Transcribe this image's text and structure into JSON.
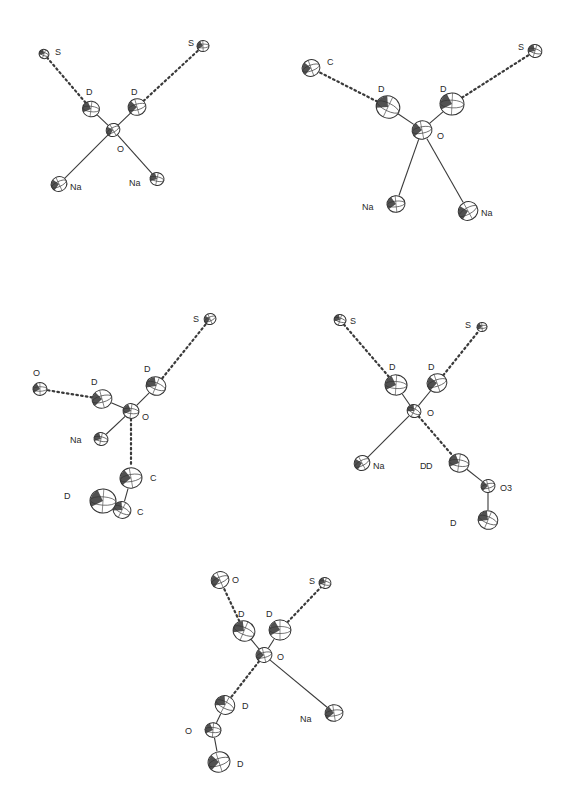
{
  "figure": {
    "panels": [
      {
        "id": "panel-1",
        "atoms": [
          {
            "id": "O",
            "label": "O",
            "x": 113,
            "y": 130,
            "r": 7,
            "lx": 117,
            "ly": 152
          },
          {
            "id": "D1",
            "label": "D",
            "x": 91,
            "y": 109,
            "r": 8.5,
            "lx": 86,
            "ly": 95
          },
          {
            "id": "D2",
            "label": "D",
            "x": 137,
            "y": 107,
            "r": 9,
            "lx": 131,
            "ly": 95
          },
          {
            "id": "S1",
            "label": "S",
            "x": 44,
            "y": 54,
            "r": 5,
            "lx": 55,
            "ly": 55
          },
          {
            "id": "S2",
            "label": "S",
            "x": 203,
            "y": 46,
            "r": 6,
            "lx": 188,
            "ly": 46
          },
          {
            "id": "Na1",
            "label": "Na",
            "x": 59,
            "y": 184,
            "r": 8,
            "lx": 70,
            "ly": 190
          },
          {
            "id": "Na2",
            "label": "Na",
            "x": 157,
            "y": 179,
            "r": 7,
            "lx": 129,
            "ly": 186
          }
        ],
        "bonds": [
          [
            "O",
            "D1"
          ],
          [
            "O",
            "D2"
          ],
          [
            "O",
            "Na1"
          ],
          [
            "O",
            "Na2"
          ]
        ],
        "hbonds": [
          [
            "D1",
            "S1"
          ],
          [
            "D2",
            "S2"
          ]
        ]
      },
      {
        "id": "panel-2",
        "atoms": [
          {
            "id": "O",
            "label": "O",
            "x": 422,
            "y": 130,
            "r": 10,
            "lx": 437,
            "ly": 139
          },
          {
            "id": "D1",
            "label": "D",
            "x": 388,
            "y": 107,
            "r": 12,
            "lx": 378,
            "ly": 92
          },
          {
            "id": "D2",
            "label": "D",
            "x": 452,
            "y": 104,
            "r": 12,
            "lx": 440,
            "ly": 92
          },
          {
            "id": "C",
            "label": "C",
            "x": 311,
            "y": 68,
            "r": 9,
            "lx": 327,
            "ly": 65
          },
          {
            "id": "S",
            "label": "S",
            "x": 535,
            "y": 51,
            "r": 7,
            "lx": 518,
            "ly": 50
          },
          {
            "id": "Na1",
            "label": "Na",
            "x": 396,
            "y": 204,
            "r": 9,
            "lx": 362,
            "ly": 210
          },
          {
            "id": "Na2",
            "label": "Na",
            "x": 468,
            "y": 211,
            "r": 10,
            "lx": 481,
            "ly": 216
          }
        ],
        "bonds": [
          [
            "O",
            "D1"
          ],
          [
            "O",
            "D2"
          ],
          [
            "O",
            "Na1"
          ],
          [
            "O",
            "Na2"
          ]
        ],
        "hbonds": [
          [
            "D1",
            "C"
          ],
          [
            "D2",
            "S"
          ]
        ]
      },
      {
        "id": "panel-3",
        "atoms": [
          {
            "id": "O",
            "label": "O",
            "x": 131,
            "y": 411,
            "r": 8,
            "lx": 142,
            "ly": 420
          },
          {
            "id": "D1",
            "label": "D",
            "x": 102,
            "y": 399,
            "r": 10,
            "lx": 91,
            "ly": 385
          },
          {
            "id": "D2",
            "label": "D",
            "x": 156,
            "y": 386,
            "r": 10,
            "lx": 144,
            "ly": 372
          },
          {
            "id": "O2",
            "label": "O",
            "x": 40,
            "y": 389,
            "r": 7,
            "lx": 33,
            "ly": 376
          },
          {
            "id": "S",
            "label": "S",
            "x": 210,
            "y": 319,
            "r": 6,
            "lx": 193,
            "ly": 322
          },
          {
            "id": "Na",
            "label": "Na",
            "x": 101,
            "y": 439,
            "r": 7,
            "lx": 70,
            "ly": 443
          },
          {
            "id": "C1",
            "label": "C",
            "x": 131,
            "y": 478,
            "r": 11,
            "lx": 150,
            "ly": 481
          },
          {
            "id": "C2",
            "label": "C",
            "x": 122,
            "y": 510,
            "r": 9,
            "lx": 137,
            "ly": 515
          },
          {
            "id": "D3",
            "label": "D",
            "x": 103,
            "y": 501,
            "r": 13,
            "lx": 64,
            "ly": 499
          }
        ],
        "bonds": [
          [
            "O",
            "D1"
          ],
          [
            "O",
            "D2"
          ],
          [
            "O",
            "Na"
          ],
          [
            "C1",
            "C2"
          ]
        ],
        "hbonds": [
          [
            "D1",
            "O2"
          ],
          [
            "D2",
            "S"
          ],
          [
            "O",
            "C1"
          ]
        ]
      },
      {
        "id": "panel-4",
        "atoms": [
          {
            "id": "O",
            "label": "O",
            "x": 414,
            "y": 411,
            "r": 7,
            "lx": 427,
            "ly": 416
          },
          {
            "id": "D1",
            "label": "D",
            "x": 396,
            "y": 385,
            "r": 11,
            "lx": 389,
            "ly": 370
          },
          {
            "id": "D2",
            "label": "D",
            "x": 437,
            "y": 383,
            "r": 10,
            "lx": 428,
            "ly": 370
          },
          {
            "id": "S1",
            "label": "S",
            "x": 340,
            "y": 320,
            "r": 6,
            "lx": 350,
            "ly": 324
          },
          {
            "id": "S2",
            "label": "S",
            "x": 482,
            "y": 327,
            "r": 5,
            "lx": 465,
            "ly": 328
          },
          {
            "id": "Na",
            "label": "Na",
            "x": 362,
            "y": 463,
            "r": 8,
            "lx": 373,
            "ly": 469
          },
          {
            "id": "D3",
            "label": "D",
            "x": 459,
            "y": 463,
            "r": 10,
            "lx": 420,
            "ly": 469
          },
          {
            "id": "O3",
            "label": "O3",
            "x": 488,
            "y": 486,
            "r": 7,
            "lx": 500,
            "ly": 491
          },
          {
            "id": "D4",
            "label": "D",
            "x": 488,
            "y": 520,
            "r": 10,
            "lx": 450,
            "ly": 526
          }
        ],
        "bonds": [
          [
            "O",
            "D1"
          ],
          [
            "O",
            "D2"
          ],
          [
            "O",
            "Na"
          ],
          [
            "D3",
            "O3"
          ],
          [
            "O3",
            "D4"
          ]
        ],
        "hbonds": [
          [
            "D1",
            "S1"
          ],
          [
            "D2",
            "S2"
          ],
          [
            "O",
            "D3"
          ]
        ],
        "extra_labels": [
          {
            "label": "D",
            "x": 426,
            "y": 469
          }
        ]
      },
      {
        "id": "panel-5",
        "atoms": [
          {
            "id": "O",
            "label": "O",
            "x": 264,
            "y": 655,
            "r": 8,
            "lx": 277,
            "ly": 660
          },
          {
            "id": "D1",
            "label": "D",
            "x": 244,
            "y": 631,
            "r": 11,
            "lx": 238,
            "ly": 617
          },
          {
            "id": "D2",
            "label": "D",
            "x": 280,
            "y": 630,
            "r": 11,
            "lx": 266,
            "ly": 617
          },
          {
            "id": "O2",
            "label": "O",
            "x": 220,
            "y": 580,
            "r": 9,
            "lx": 232,
            "ly": 583
          },
          {
            "id": "S",
            "label": "S",
            "x": 325,
            "y": 583,
            "r": 6,
            "lx": 309,
            "ly": 584
          },
          {
            "id": "Na",
            "label": "Na",
            "x": 334,
            "y": 713,
            "r": 9,
            "lx": 300,
            "ly": 722
          },
          {
            "id": "D3",
            "label": "D",
            "x": 225,
            "y": 705,
            "r": 10,
            "lx": 242,
            "ly": 709
          },
          {
            "id": "O3",
            "label": "O",
            "x": 213,
            "y": 730,
            "r": 8,
            "lx": 185,
            "ly": 734
          },
          {
            "id": "D4",
            "label": "D",
            "x": 219,
            "y": 762,
            "r": 11,
            "lx": 237,
            "ly": 767
          }
        ],
        "bonds": [
          [
            "O",
            "D1"
          ],
          [
            "O",
            "D2"
          ],
          [
            "O",
            "Na"
          ],
          [
            "D3",
            "O3"
          ],
          [
            "O3",
            "D4"
          ]
        ],
        "hbonds": [
          [
            "D1",
            "O2"
          ],
          [
            "D2",
            "S"
          ],
          [
            "O",
            "D3"
          ]
        ]
      }
    ]
  }
}
